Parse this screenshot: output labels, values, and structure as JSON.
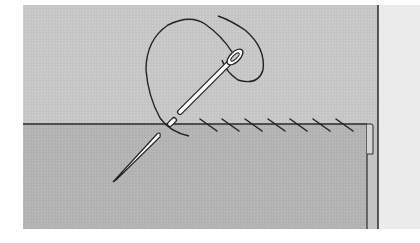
{
  "diagram": {
    "colors": {
      "page_background": "#ffffff",
      "fabric_upper": "#c9c9c9",
      "fabric_lower": "#b5b5b5",
      "right_strip": "#ebebeb",
      "outline": "#2a2a2a",
      "thread": "#222222",
      "needle_fill": "#ffffff"
    },
    "regions": {
      "upper_fabric": {
        "x": 23,
        "y": 5,
        "w": 355,
        "h": 119
      },
      "lower_fabric": {
        "x": 23,
        "y": 124,
        "w": 344,
        "h": 105
      },
      "right_strip": {
        "x": 378,
        "y": 5,
        "w": 42,
        "h": 224
      }
    },
    "hem_line_y": 124,
    "fold_edge_x": 367,
    "stitches": [
      {
        "x1": 200,
        "y1": 119,
        "x2": 217,
        "y2": 131
      },
      {
        "x1": 222,
        "y1": 119,
        "x2": 239,
        "y2": 131
      },
      {
        "x1": 245,
        "y1": 119,
        "x2": 262,
        "y2": 131
      },
      {
        "x1": 268,
        "y1": 119,
        "x2": 285,
        "y2": 131
      },
      {
        "x1": 290,
        "y1": 119,
        "x2": 307,
        "y2": 131
      },
      {
        "x1": 313,
        "y1": 119,
        "x2": 330,
        "y2": 131
      },
      {
        "x1": 336,
        "y1": 119,
        "x2": 353,
        "y2": 131
      }
    ],
    "needle": {
      "eye_center": [
        234,
        58
      ],
      "tip": [
        113,
        181
      ]
    }
  }
}
